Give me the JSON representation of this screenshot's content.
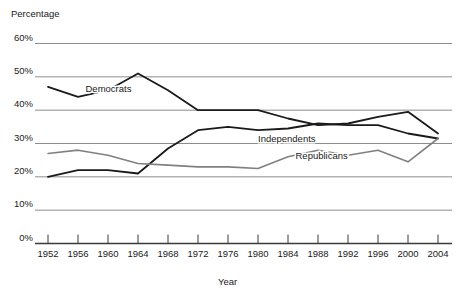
{
  "chart_data": {
    "type": "line",
    "title": "",
    "xlabel": "Year",
    "ylabel": "Percentage",
    "x": [
      1952,
      1956,
      1960,
      1964,
      1968,
      1972,
      1976,
      1980,
      1984,
      1988,
      1992,
      1996,
      2000,
      2004
    ],
    "xlim": [
      1950,
      2006
    ],
    "ylim": [
      0,
      60
    ],
    "yticks": [
      0,
      10,
      20,
      30,
      40,
      50,
      60
    ],
    "ytick_labels": [
      "0%",
      "10%",
      "20%",
      "30%",
      "40%",
      "50%",
      "60%"
    ],
    "xtick_labels": [
      "1952",
      "1956",
      "1960",
      "1964",
      "1968",
      "1972",
      "1976",
      "1980",
      "1984",
      "1988",
      "1992",
      "1996",
      "2000",
      "2004"
    ],
    "grid": true,
    "grid_axis": "y",
    "legend": "inline-labels",
    "series": [
      {
        "name": "Democrats",
        "color": "#1a1a1a",
        "width": 1.8,
        "label_x": 1957,
        "label_y": 45.5,
        "values": [
          47,
          44,
          46,
          51,
          46,
          40,
          40,
          40,
          37.5,
          35.5,
          36,
          38,
          39.5,
          33
        ]
      },
      {
        "name": "Independents",
        "color": "#1a1a1a",
        "width": 1.8,
        "label_x": 1980,
        "label_y": 30.5,
        "values": [
          20,
          22,
          22,
          21,
          28.5,
          34,
          35,
          34,
          34.5,
          36,
          35.5,
          35.5,
          33,
          31.5
        ]
      },
      {
        "name": "Republicans",
        "color": "#808080",
        "width": 1.6,
        "label_x": 1985,
        "label_y": 25.5,
        "values": [
          27,
          28,
          26.5,
          24,
          23.5,
          23,
          23,
          22.5,
          26,
          28,
          26.5,
          28,
          24.5,
          31.5
        ]
      }
    ]
  },
  "axes": {
    "y_title": "Percentage",
    "x_title": "Year"
  }
}
